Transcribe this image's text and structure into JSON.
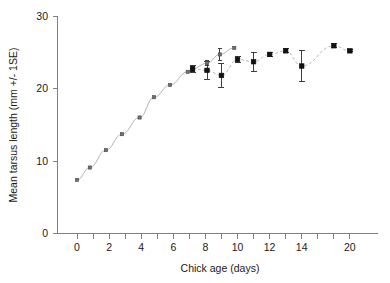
{
  "chart_data": {
    "type": "scatter",
    "title": "",
    "xlabel": "Chick age (days)",
    "ylabel": "Mean tarsus length (mm +/- 1SE)",
    "xlim": [
      -1,
      21
    ],
    "ylim": [
      0,
      30
    ],
    "grid": false,
    "legend": "none",
    "x_tick_labels": [
      "0",
      "2",
      "4",
      "6",
      "8",
      "10",
      "12",
      "14",
      "20"
    ],
    "x_tick_values": [
      0,
      2,
      4,
      6,
      8,
      10,
      12,
      14,
      20
    ],
    "x_minor_tick_values": [
      1,
      3,
      5,
      7,
      9,
      11,
      13,
      16,
      18
    ],
    "y_tick_labels": [
      "0",
      "10",
      "20",
      "30"
    ],
    "y_tick_values": [
      0,
      10,
      20,
      30
    ],
    "axis_note": "x axis is compressed after day 14; ticks remain evenly spaced through the 20 label",
    "series": [
      {
        "name": "growth curve (open squares)",
        "marker": "small-square",
        "connected": true,
        "line_style": "solid",
        "x": [
          0,
          0.8,
          1.8,
          2.8,
          3.9,
          4.8,
          5.8,
          6.9,
          7.2,
          8.1,
          8.9,
          9.8
        ],
        "y": [
          7.4,
          9.1,
          11.5,
          13.7,
          16.0,
          18.8,
          20.5,
          22.3,
          22.7,
          23.5,
          24.7,
          25.6
        ],
        "errors": [
          0,
          0,
          0,
          0,
          0,
          0,
          0,
          0,
          0.4,
          0.3,
          0.8,
          0
        ]
      },
      {
        "name": "measured means (filled squares)",
        "marker": "filled-square",
        "connected": true,
        "line_style": "dashed",
        "x": [
          7.2,
          8.1,
          9.0,
          10.0,
          11.0,
          12.0,
          13.0,
          14.0,
          18.0,
          20.0
        ],
        "y": [
          22.7,
          22.5,
          21.8,
          24.0,
          23.7,
          24.7,
          25.2,
          23.1,
          25.9,
          25.2
        ],
        "errors": [
          0.45,
          1.2,
          1.6,
          0.45,
          1.3,
          0.3,
          0.25,
          2.2,
          0.25,
          0.15
        ]
      }
    ]
  }
}
